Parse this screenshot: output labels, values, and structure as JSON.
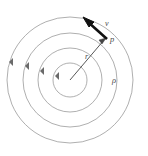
{
  "figure": {
    "background_color": "#ffffff",
    "center": {
      "x": 70,
      "y": 80
    },
    "circle_color": "#8c8c8c",
    "arrow_color": "#3a3a3a",
    "vector_color": "#111111",
    "label_color": "#4a4a4a",
    "circles": [
      {
        "name": "innermost-circle",
        "radius": 17
      },
      {
        "name": "inner-middle-circle",
        "radius": 32
      },
      {
        "name": "outer-middle-circle",
        "radius": 47
      },
      {
        "name": "outermost-circle",
        "radius": 63
      }
    ],
    "direction_arrows": [
      {
        "name": "flow-arrow-outermost",
        "angle_deg": 196
      },
      {
        "name": "flow-arrow-outer-middle",
        "angle_deg": 191
      },
      {
        "name": "flow-arrow-inner-middle",
        "angle_deg": 186
      },
      {
        "name": "flow-arrow-innermost",
        "angle_deg": 178
      }
    ],
    "radius_vector": {
      "name": "radius-vector",
      "from": {
        "x": 70,
        "y": 80
      },
      "to": {
        "x": 106,
        "y": 38
      }
    },
    "velocity_vector": {
      "name": "velocity-vector",
      "from": {
        "x": 106,
        "y": 38
      },
      "to": {
        "x": 84,
        "y": 18
      }
    },
    "labels": {
      "velocity": "v",
      "point": "p",
      "radius": "r",
      "rho": "ρ"
    }
  }
}
